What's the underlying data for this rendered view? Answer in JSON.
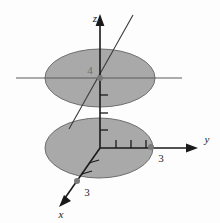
{
  "figure": {
    "background_color": "#fdfdfd",
    "disc_fill_color": "#a9a9a9",
    "disc_stroke_color": "#6e6e6e",
    "axis_color": "#1a1a1a",
    "guide_line_color": "#555555",
    "marker_color": "#7a7a7a"
  },
  "axes": [
    {
      "id": "z",
      "label": "z",
      "direction": "up",
      "arrow": true
    },
    {
      "id": "y",
      "label": "y",
      "direction": "right",
      "arrow": true
    },
    {
      "id": "x",
      "label": "x",
      "direction": "down-left",
      "arrow": true
    }
  ],
  "markers": [
    {
      "id": "y-intercept",
      "label": "3",
      "axis": "y",
      "value": 3
    },
    {
      "id": "x-intercept",
      "label": "3",
      "axis": "x",
      "value": 3
    },
    {
      "id": "z-upper-disc",
      "label": "4",
      "axis": "z",
      "value": 4
    }
  ],
  "discs": [
    {
      "id": "upper-disc",
      "height_label": "4",
      "radius": 3
    },
    {
      "id": "lower-disc",
      "height_label": "0",
      "radius": 3
    }
  ],
  "guide_lines": [
    {
      "id": "y-parallel-through-upper-center",
      "orientation": "horizontal"
    },
    {
      "id": "x-parallel-through-upper-center",
      "orientation": "diagonal"
    }
  ]
}
